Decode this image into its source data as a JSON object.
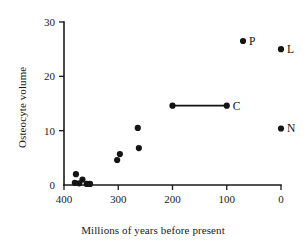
{
  "chart_data": {
    "type": "scatter",
    "title": "",
    "xlabel": "Millions of years before present",
    "ylabel": "Osteocyte volume",
    "xlim": [
      400,
      0
    ],
    "ylim": [
      0,
      30
    ],
    "x_ticks": [
      400,
      300,
      200,
      100,
      0
    ],
    "y_ticks": [
      0,
      10,
      20,
      30
    ],
    "x_axis_reversed": true,
    "grid": false,
    "legend": "none",
    "points": [
      {
        "x": 380,
        "y": 0.4,
        "label": ""
      },
      {
        "x": 378,
        "y": 2.0,
        "label": ""
      },
      {
        "x": 372,
        "y": 0.3,
        "label": ""
      },
      {
        "x": 366,
        "y": 1.0,
        "label": ""
      },
      {
        "x": 358,
        "y": 0.2,
        "label": ""
      },
      {
        "x": 352,
        "y": 0.2,
        "label": ""
      },
      {
        "x": 302,
        "y": 4.6,
        "label": ""
      },
      {
        "x": 297,
        "y": 5.7,
        "label": ""
      },
      {
        "x": 262,
        "y": 6.8,
        "label": ""
      },
      {
        "x": 264,
        "y": 10.5,
        "label": ""
      },
      {
        "x": 70,
        "y": 26.5,
        "label": "P"
      },
      {
        "x": 0,
        "y": 25.0,
        "label": "L"
      },
      {
        "x": 0,
        "y": 10.4,
        "label": "N"
      }
    ],
    "range_bars": [
      {
        "x_start": 200,
        "x_end": 100,
        "y": 14.6,
        "label": "C"
      }
    ],
    "colors": {
      "marker": "#141414",
      "axis": "#1a1a1a",
      "background": "#ffffff"
    }
  },
  "labels": {
    "x_axis_title": "Millions of years before present",
    "y_axis_title": "Osteocyte volume"
  }
}
